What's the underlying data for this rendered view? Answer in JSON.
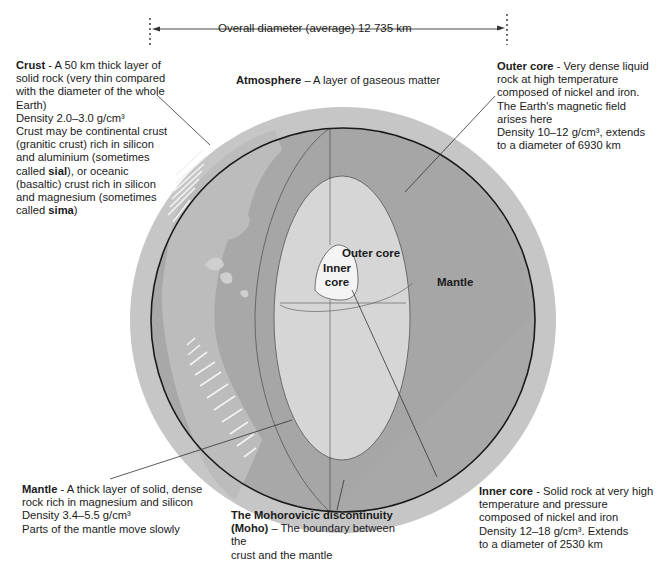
{
  "dimension": {
    "label": "Overall diameter (average) 12 735 km"
  },
  "layers": {
    "crust": {
      "title": "Crust",
      "line1": " - A 50 km thick layer of",
      "line2": "solid rock (very thin compared",
      "line3": "with the diameter of the whole",
      "line4": "Earth)",
      "density": "Density  2.0–3.0 g/cm³",
      "line6": "Crust may be continental crust",
      "line7": "(granitic crust) rich in silicon",
      "line8": "and aluminium (sometimes",
      "line9a": "called ",
      "line9b": "sial",
      "line9c": "), or oceanic",
      "line10": "(basaltic) crust rich in silicon",
      "line11": "and magnesium (sometimes",
      "line12a": "called ",
      "line12b": "sima",
      "line12c": ")"
    },
    "atmosphere": {
      "title": "Atmosphere",
      "text": " – A layer of gaseous matter"
    },
    "outer_core": {
      "title": "Outer core",
      "line1": " - Very dense liquid",
      "line2": "rock at high temperature",
      "line3": "composed of nickel and iron.",
      "line4": "The Earth's magnetic field",
      "line5": "arises here",
      "line6": "Density  10–12 g/cm³, extends",
      "line7": "to a diameter of 6930 km"
    },
    "mantle": {
      "title": "Mantle",
      "line1": " - A thick layer of solid, dense",
      "line2": "rock rich in magnesium and silicon",
      "line3": "Density  3.4–5.5 g/cm³",
      "line4": "Parts of the mantle move slowly"
    },
    "moho": {
      "title1": "The Mohorovicic discontinuity",
      "title2": "(Moho)",
      "line2": " – The boundary between the",
      "line3": "crust and the mantle"
    },
    "inner_core": {
      "title": "Inner core",
      "line1": " - Solid rock at very high",
      "line2": "temperature and pressure",
      "line3": "composed of nickel and iron",
      "line4": "Density  12–18 g/cm³.   Extends",
      "line5": "to a diameter of 2530 km"
    }
  },
  "diagram_labels": {
    "outer_core": "Outer core",
    "inner_core_1": "Inner",
    "inner_core_2": "core",
    "mantle": "Mantle"
  },
  "colors": {
    "atmosphere": "#c8c8c8",
    "mantle": "#a9a9a9",
    "crust_land": "#bdbdbd",
    "outer_core": "#d6d6d6",
    "inner_core": "#f4f4f4",
    "line": "#1a1a1a"
  }
}
